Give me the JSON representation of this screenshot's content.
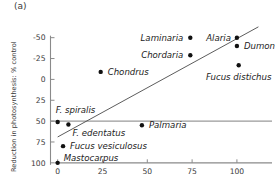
{
  "panel": {
    "label": "(a)"
  },
  "axes": {
    "ylabel": "Reduction in photosynthesis: % control",
    "xlabel": "",
    "yticks": [
      "100",
      "75",
      "50",
      "25",
      "0",
      "-25",
      "-50"
    ],
    "xticks": [
      "0",
      "25",
      "50",
      "75",
      "100"
    ]
  },
  "colors": {
    "point": "#111111",
    "axis": "#8a8a8a",
    "fit_line": "#4a4a4a",
    "zero_line": "#9a9a9a",
    "text": "#3a3a3a",
    "background": "#ffffff"
  },
  "chart_data": {
    "type": "scatter",
    "title": "(a)",
    "xlabel": "",
    "ylabel": "Reduction in photosynthesis: % control",
    "xlim": [
      -4,
      114
    ],
    "ylim": [
      -52,
      108
    ],
    "xticks": [
      0,
      25,
      50,
      75,
      100
    ],
    "yticks": [
      -50,
      -25,
      0,
      25,
      50,
      75,
      100
    ],
    "grid": false,
    "legend": false,
    "zero_reference_line": 0,
    "points": [
      {
        "label": "F. spiralis",
        "x": 0,
        "y": -1,
        "label_dx": -2,
        "label_dy": -9,
        "label_anchor": "start"
      },
      {
        "label": "Mastocarpus",
        "x": 0,
        "y": -50,
        "label_dx": 6,
        "label_dy": -2,
        "label_anchor": "start"
      },
      {
        "label": "Fucus vesiculosus",
        "x": 3,
        "y": -30,
        "label_dx": 7,
        "label_dy": 3,
        "label_anchor": "start"
      },
      {
        "label": "F. edentatus",
        "x": 6,
        "y": -4,
        "label_dx": 4,
        "label_dy": 12,
        "label_anchor": "start"
      },
      {
        "label": "Chondrus",
        "x": 24,
        "y": 59,
        "label_dx": 7,
        "label_dy": 3,
        "label_anchor": "start"
      },
      {
        "label": "Palmaria",
        "x": 47,
        "y": -5,
        "label_dx": 7,
        "label_dy": 3,
        "label_anchor": "start"
      },
      {
        "label": "Chordaria",
        "x": 74,
        "y": 79,
        "label_dx": -7,
        "label_dy": 3,
        "label_anchor": "end"
      },
      {
        "label": "Laminaria",
        "x": 74,
        "y": 100,
        "label_dx": -7,
        "label_dy": 3,
        "label_anchor": "end"
      },
      {
        "label": "Alaria",
        "x": 100,
        "y": 100,
        "label_dx": -6,
        "label_dy": 3,
        "label_anchor": "end"
      },
      {
        "label": "Dumontia",
        "x": 100,
        "y": 90,
        "label_dx": 7,
        "label_dy": 3,
        "label_anchor": "start"
      },
      {
        "label": "Fucus distichus",
        "x": 101,
        "y": 67,
        "label_dx": 0,
        "label_dy": 15,
        "label_anchor": "middle"
      }
    ],
    "fit_line": {
      "x0": 0,
      "y0": -19,
      "x1": 112,
      "y1": 113
    }
  }
}
